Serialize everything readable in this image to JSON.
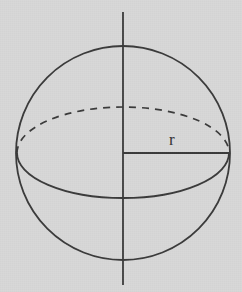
{
  "figure": {
    "kind": "sphere-radius-diagram",
    "canvas": {
      "width": 242,
      "height": 292
    },
    "colors": {
      "background": "#d8d8d8",
      "stroke": "#3a3a3a",
      "label": "#343434"
    },
    "labels": {
      "radius": "r"
    },
    "label_positions": {
      "radius": {
        "x": 169,
        "y": 131
      }
    },
    "geometry": {
      "circle": {
        "cx": 123,
        "cy": 153,
        "r": 107,
        "stroke_width": 1.8
      },
      "vertical_axis": {
        "x": 123,
        "y1": 12,
        "y2": 285,
        "stroke_width": 1.8
      },
      "radius_line": {
        "x1": 123,
        "y1": 153,
        "x2": 229,
        "y2": 153,
        "stroke_width": 1.8
      },
      "equator_back_dashed": {
        "cx": 123,
        "cy": 153,
        "rx": 106,
        "ry": 46,
        "dash": "7 6",
        "stroke_width": 1.7,
        "half": "upper"
      },
      "equator_front_solid": {
        "cx": 123,
        "cy": 153,
        "rx": 106,
        "ry": 45,
        "stroke_width": 1.8,
        "half": "lower"
      }
    }
  }
}
